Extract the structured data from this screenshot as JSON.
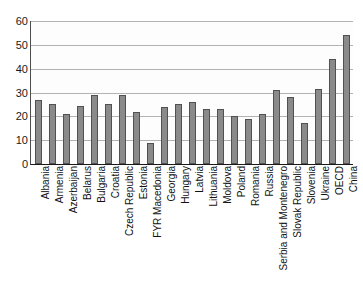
{
  "chart_data": {
    "type": "bar",
    "title": "",
    "subtitle": "",
    "xlabel": "",
    "ylabel": "",
    "ylim": [
      0,
      60
    ],
    "yticks": [
      0,
      10,
      20,
      30,
      40,
      50,
      60
    ],
    "ytick_labels": [
      "0",
      "10",
      "20",
      "30",
      "40",
      "50",
      "60"
    ],
    "grid": true,
    "legend": false,
    "legend_position": "none",
    "bar_color": "#8a8a8a",
    "bar_border_color": "#515151",
    "gridline_color": "#b3b3b3",
    "axis_color": "#1a1a1a",
    "categories": [
      "Albania",
      "Armenia",
      "Azerbaijan",
      "Belarus",
      "Bulgaria",
      "Croatia",
      "Czech Republic",
      "Estonia",
      "FYR Macedonia",
      "Georgia",
      "Hungary",
      "Latvia",
      "Lithuania",
      "Moldova",
      "Poland",
      "Romania",
      "Russia",
      "Serbia and Montenegro",
      "Slovak Republic",
      "Slovenia",
      "Ukraine",
      "OECD",
      "China"
    ],
    "values": [
      27,
      25,
      21,
      24.5,
      29,
      25,
      29,
      22,
      9,
      24,
      25,
      26,
      23,
      23,
      20,
      19,
      21,
      31,
      28,
      17,
      31.5,
      44,
      54
    ]
  }
}
